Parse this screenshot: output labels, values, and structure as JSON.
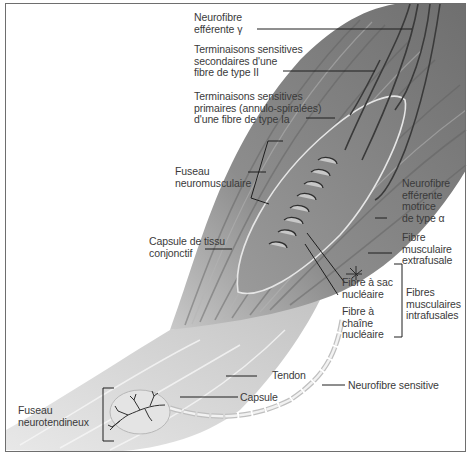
{
  "diagram": {
    "colors": {
      "muscle": "#8a8a8a",
      "muscle_dark": "#5a5a5a",
      "tendon": "#d8d8d8",
      "label_text": "#3a3a3a",
      "leader_line": "#1e1e1e",
      "frame": "#6e6e6e"
    },
    "labels": {
      "gamma_efferent": "Neurofibre\nefférente γ",
      "secondary_endings": "Terminaisons sensitives\nsecondaires d'une\nfibre de type II",
      "primary_endings": "Terminaisons sensitives\nprimaires (annulo-spiralées)\nd'une fibre de type Ia",
      "muscle_spindle": "Fuseau\nneuromusculaire",
      "alpha_motor": "Neurofibre\nefférente\nmotrice\nde type α",
      "connective_capsule": "Capsule de tissu\nconjonctif",
      "extrafusal_fibre": "Fibre\nmusculaire\nextrafusale",
      "nuclear_bag_fibre": "Fibre à sac\nnucléaire",
      "intrafusal_fibres": "Fibres\nmusculaires\nintrafusales",
      "nuclear_chain_fibre": "Fibre à\nchaîne\nnucléaire",
      "tendon": "Tendon",
      "sensory_neurofibre": "Neurofibre sensitive",
      "capsule": "Capsule",
      "golgi_tendon_organ": "Fuseau\nneurotendineux"
    }
  }
}
